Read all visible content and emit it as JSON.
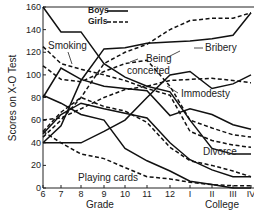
{
  "chart_data": {
    "type": "line",
    "title": "",
    "xlabel": "Grade",
    "xlabel2": "College",
    "ylabel": "Scores on X-O Test",
    "ylim": [
      0,
      160
    ],
    "yticks": [
      0,
      20,
      40,
      60,
      80,
      100,
      120,
      140,
      160
    ],
    "categories": [
      "6",
      "7",
      "8",
      "9",
      "10",
      "11",
      "12",
      "I",
      "II",
      "III",
      "IV"
    ],
    "grid": false,
    "legend": {
      "position": "top-center",
      "entries": [
        {
          "label": "Boys",
          "style": "solid"
        },
        {
          "label": "Girls",
          "style": "dashed"
        }
      ]
    },
    "annotations": [
      "Smoking",
      "Being conceited",
      "Bribery",
      "Immodesty",
      "Divorce",
      "Playing cards"
    ],
    "series": [
      {
        "name": "Smoking (Boys)",
        "style": "solid",
        "values": [
          160,
          138,
          138,
          110,
          98,
          90,
          85,
          60,
          35,
          30,
          30
        ]
      },
      {
        "name": "Smoking (Girls)",
        "style": "dashed",
        "values": [
          125,
          110,
          105,
          100,
          95,
          88,
          82,
          50,
          42,
          38,
          36
        ]
      },
      {
        "name": "Being conceited (Boys)",
        "style": "solid",
        "values": [
          80,
          106,
          96,
          90,
          88,
          86,
          64,
          70,
          65,
          56,
          52
        ]
      },
      {
        "name": "Being conceited (Girls)",
        "style": "dashed",
        "values": [
          108,
          96,
          94,
          103,
          110,
          113,
          90,
          60,
          53,
          47,
          45
        ]
      },
      {
        "name": "Bribery (Boys)",
        "style": "solid",
        "values": [
          40,
          55,
          95,
          123,
          124,
          128,
          129,
          130,
          132,
          135,
          155
        ]
      },
      {
        "name": "Bribery (Girls)",
        "style": "dashed",
        "values": [
          45,
          60,
          80,
          110,
          120,
          127,
          140,
          148,
          150,
          150,
          155
        ]
      },
      {
        "name": "Immodesty (Boys)",
        "style": "solid",
        "values": [
          40,
          40,
          40,
          50,
          60,
          80,
          100,
          103,
          88,
          92,
          100
        ]
      },
      {
        "name": "Immodesty (Girls)",
        "style": "dashed",
        "values": [
          60,
          62,
          70,
          80,
          87,
          90,
          95,
          96,
          97,
          95,
          93
        ]
      },
      {
        "name": "Divorce (Boys)",
        "style": "solid",
        "values": [
          48,
          65,
          75,
          70,
          66,
          62,
          40,
          25,
          16,
          10,
          10
        ]
      },
      {
        "name": "Divorce (Girls)",
        "style": "dashed",
        "values": [
          50,
          67,
          80,
          72,
          68,
          58,
          36,
          24,
          20,
          15,
          10
        ]
      },
      {
        "name": "Playing cards (Boys)",
        "style": "solid",
        "values": [
          82,
          75,
          65,
          60,
          35,
          24,
          15,
          6,
          3,
          0,
          0
        ]
      },
      {
        "name": "Playing cards (Girls)",
        "style": "dashed",
        "values": [
          50,
          40,
          30,
          26,
          18,
          10,
          8,
          5,
          3,
          2,
          2
        ]
      }
    ]
  }
}
